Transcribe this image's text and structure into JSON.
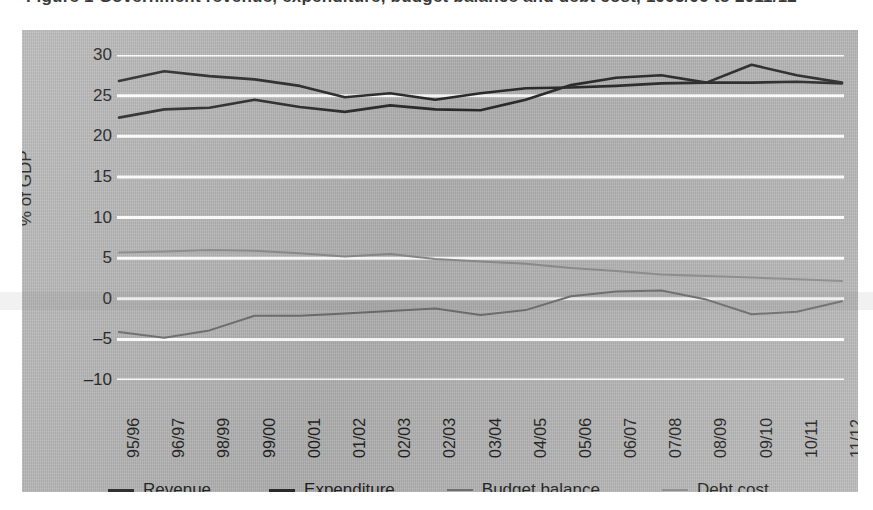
{
  "figure": {
    "cropped_caption": "Figure 1  Government revenue, expenditure, budget balance and debt cost, 1995/96 to 2011/12",
    "background_color": "#b6b6b6",
    "gridline_color": "#ffffff"
  },
  "chart_data": {
    "type": "line",
    "title": "",
    "xlabel": "",
    "ylabel": "% of GDP",
    "ylim": [
      -10,
      30
    ],
    "yticks": [
      30,
      25,
      20,
      15,
      10,
      5,
      0,
      -5,
      -10
    ],
    "ytick_labels": [
      "30",
      "25",
      "20",
      "15",
      "10",
      "5",
      "0",
      "–10",
      "–5"
    ],
    "grid": true,
    "legend_position": "bottom",
    "categories": [
      "95/96",
      "96/97",
      "98/99",
      "99/00",
      "00/01",
      "01/02",
      "02/03",
      "02/03",
      "03/04",
      "04/05",
      "05/06",
      "06/07",
      "07/08",
      "08/09",
      "09/10",
      "10/11",
      "11/12"
    ],
    "series": [
      {
        "name": "Revenue",
        "color": "#2b2b2b",
        "values": [
          22.3,
          23.3,
          23.5,
          24.5,
          23.6,
          23.0,
          23.8,
          23.3,
          23.2,
          24.5,
          26.3,
          27.2,
          27.5,
          26.6,
          26.6,
          26.7,
          26.5
        ]
      },
      {
        "name": "Expenditure",
        "color": "#2b2b2b",
        "values": [
          26.8,
          28.0,
          27.4,
          27.0,
          26.2,
          24.8,
          25.3,
          24.5,
          25.3,
          25.9,
          26.0,
          26.2,
          26.5,
          26.6,
          28.8,
          27.5,
          26.6
        ]
      },
      {
        "name": "Budget balance",
        "color": "#6e6e6e",
        "values": [
          -4.1,
          -4.8,
          -3.9,
          -2.1,
          -2.1,
          -1.8,
          -1.5,
          -1.2,
          -2.0,
          -1.4,
          0.3,
          0.9,
          1.0,
          -0.1,
          -1.9,
          -1.6,
          -0.3
        ]
      },
      {
        "name": "Debt cost",
        "color": "#8c8c8c",
        "values": [
          5.7,
          5.8,
          6.0,
          5.9,
          5.6,
          5.2,
          5.5,
          4.9,
          4.6,
          4.3,
          3.8,
          3.4,
          3.0,
          2.8,
          2.6,
          2.4,
          2.2
        ]
      }
    ]
  }
}
